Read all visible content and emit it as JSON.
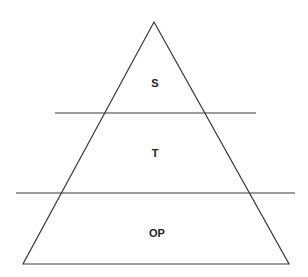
{
  "diagram": {
    "type": "pyramid",
    "layers": [
      {
        "label": "S"
      },
      {
        "label": "T"
      },
      {
        "label": "OP"
      }
    ],
    "stroke_color": "#3a3a3a"
  }
}
